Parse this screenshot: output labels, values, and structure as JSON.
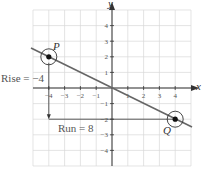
{
  "chart_data": {
    "type": "line",
    "title": "",
    "xlabel": "x",
    "ylabel": "y",
    "xlim": [
      -5,
      5
    ],
    "ylim": [
      -5,
      5
    ],
    "grid": true,
    "x_ticks": [
      -4,
      -3,
      -2,
      -1,
      1,
      2,
      3,
      4
    ],
    "y_ticks": [
      4,
      3,
      2,
      1,
      -1,
      -2,
      -3,
      -4
    ],
    "series": [
      {
        "name": "line",
        "x": [
          -5,
          5
        ],
        "y": [
          2.5,
          -2.5
        ],
        "slope": -0.5
      }
    ],
    "points": [
      {
        "label": "P",
        "x": -4,
        "y": 2
      },
      {
        "label": "Q",
        "x": 4,
        "y": -2
      }
    ],
    "annotations": [
      {
        "text": "Rise = −4",
        "type": "vertical-arrow",
        "from": [
          -4,
          2
        ],
        "to": [
          -4,
          -2
        ]
      },
      {
        "text": "Run = 8",
        "type": "horizontal-line",
        "from": [
          -4,
          -2
        ],
        "to": [
          4,
          -2
        ]
      }
    ]
  },
  "labels": {
    "x_axis": "x",
    "y_axis": "y",
    "point_p": "P",
    "point_q": "Q",
    "rise": "Rise = −4",
    "run": "Run = 8"
  },
  "colors": {
    "grid": "#d9d9d9",
    "axis": "#333333",
    "line": "#666666",
    "point": "#111111",
    "text": "#555555"
  }
}
